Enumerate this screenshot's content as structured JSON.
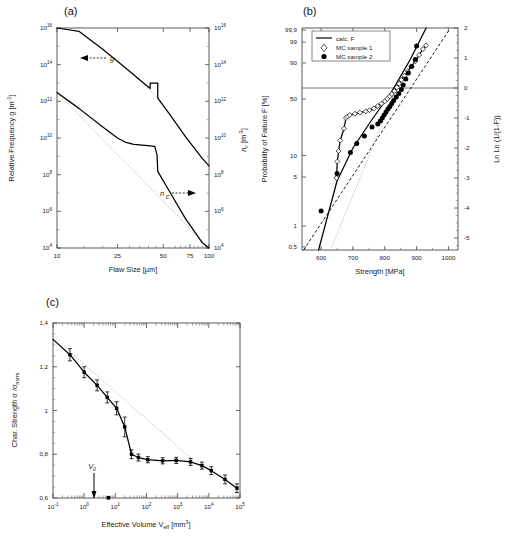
{
  "figure": {
    "panels": [
      "(a)",
      "(b)",
      "(c)"
    ]
  },
  "panel_a": {
    "label": "(a)",
    "xlabel": "Flaw Size [µm]",
    "ylabel_left": "Relative Frequency g  [m",
    "ylabel_left_exp": "-1",
    "ylabel_left_tail": "]",
    "ylabel_right": "n",
    "ylabel_right_sub": "c",
    "ylabel_right_unit": " [m",
    "ylabel_right_exp": "-3",
    "ylabel_right_tail": "]",
    "xticks": [
      "10",
      "25",
      "50",
      "75",
      "100"
    ],
    "yticks_left": [
      "10",
      "10",
      "10",
      "10",
      "10",
      "10",
      "10"
    ],
    "yticks_left_exp": [
      "16",
      "14",
      "12",
      "10",
      "8",
      "6",
      "4"
    ],
    "yticks_right": [
      "10",
      "10",
      "10",
      "10",
      "10",
      "10",
      "10"
    ],
    "yticks_right_exp": [
      "16",
      "14",
      "12",
      "10",
      "8",
      "6",
      "4"
    ],
    "annotation_g": "g",
    "annotation_nc": "n",
    "annotation_nc_sub": "c"
  },
  "panel_b": {
    "label": "(b)",
    "xlabel": "Strength [MPa]",
    "ylabel_left": "Probability of Failure F [%]",
    "ylabel_right": "Ln Ln (1/(1-F))",
    "xticks": [
      "600",
      "700",
      "800",
      "900",
      "1000"
    ],
    "yticks_left": [
      "99,9",
      "99",
      "90",
      "50",
      "10",
      "5",
      "1",
      "0,5"
    ],
    "yticks_right": [
      "2",
      "1",
      "0",
      "-1",
      "-2",
      "-3",
      "-4",
      "-5"
    ],
    "legend": [
      {
        "label": "calc. F",
        "marker": "line"
      },
      {
        "label": "MC sample 1",
        "marker": "open-diamond"
      },
      {
        "label": "MC sample 2",
        "marker": "filled-circle"
      }
    ]
  },
  "panel_c": {
    "label": "(c)",
    "xlabel_pre": "Effective Volume  V",
    "xlabel_sub": "eff",
    "xlabel_unit": " [mm",
    "xlabel_exp": "3",
    "xlabel_tail": "]",
    "ylabel_pre": "Char. Strength  σ /σ",
    "ylabel_sub": "norm",
    "xticks": [
      "10",
      "10",
      "10",
      "10",
      "10",
      "10",
      "10"
    ],
    "xticks_exp": [
      "-1",
      "0",
      "1",
      "2",
      "3",
      "4",
      "5"
    ],
    "yticks": [
      "1,4",
      "1,2",
      "1",
      "0,8",
      "0,6"
    ],
    "annotation_v0": "V",
    "annotation_v0_sub": "0"
  },
  "chart_data": [
    {
      "type": "line",
      "id": "panel_a",
      "title": "(a)",
      "xlabel": "Flaw Size [µm]",
      "ylabel": "Relative Frequency g [m^-1]",
      "ylabel2": "n_c [m^-3]",
      "xscale": "log",
      "yscale": "log",
      "xlim": [
        10,
        100
      ],
      "ylim": [
        10000.0,
        1e+16
      ],
      "ylim2": [
        10000.0,
        1e+16
      ],
      "grid": false,
      "series": [
        {
          "name": "n_c",
          "note": "upper straight line with rectangular pulse near 41-46 um",
          "x": [
            10,
            14,
            20,
            28,
            41,
            41,
            46,
            46,
            55,
            70,
            90,
            100
          ],
          "y": [
            1e+17,
            6500000000000000.0,
            700000000000000.0,
            70000000000000.0,
            5000000000000.0,
            10000000000000.0,
            10000000000000.0,
            1500000000000.0,
            200000000000.0,
            12000000000.0,
            800000000.0,
            300000000.0
          ]
        },
        {
          "name": "g",
          "note": "lower curve with shoulder plateau 28-45 um then sharp drop",
          "x": [
            10,
            14,
            20,
            25,
            28,
            32,
            38,
            44,
            45.5,
            46,
            55,
            70,
            90,
            100
          ],
          "y": [
            3000000000000.0,
            400000000000.0,
            40000000000.0,
            10000000000.0,
            6000000000.0,
            4500000000.0,
            4000000000.0,
            3500000000.0,
            1200000000.0,
            150000000.0,
            12000000.0,
            400000.0,
            20000.0,
            10000.0
          ]
        },
        {
          "name": "g-reference-dotted",
          "note": "dotted extrapolation of pure power law",
          "x": [
            10,
            100
          ],
          "y": [
            3000000000000.0,
            10000.0
          ]
        }
      ],
      "annotations": [
        "g (left arrow)",
        "n_c (right arrow)"
      ]
    },
    {
      "type": "scatter",
      "id": "panel_b",
      "title": "(b)",
      "xlabel": "Strength [MPa]",
      "ylabel": "Probability of Failure F [%]",
      "ylabel2": "Ln Ln (1/(1-F))",
      "xlim": [
        540,
        1030
      ],
      "ylim_weibull": [
        -5.4,
        2.0
      ],
      "ytick_percent": [
        99.9,
        99,
        90,
        50,
        10,
        5,
        1,
        0.5
      ],
      "ytick_lnln": [
        2,
        1,
        0,
        -1,
        -2,
        -3,
        -4,
        -5
      ],
      "grid": false,
      "legend_position": "top-left",
      "series": [
        {
          "name": "calc. F",
          "marker": "line",
          "note": "solid calculated line, steep",
          "x": [
            592,
            650,
            700,
            760,
            820,
            880,
            930
          ],
          "y_lnln": [
            -5.4,
            -3.1,
            -2.0,
            -1.05,
            -0.15,
            0.95,
            2.0
          ]
        },
        {
          "name": "MC sample 1",
          "marker": "open-diamond",
          "x": [
            648,
            651,
            655,
            660,
            672,
            678,
            683,
            690,
            706,
            722,
            740,
            752,
            766,
            778,
            790,
            800,
            808,
            815,
            822,
            830,
            838,
            845,
            852,
            862,
            872,
            884,
            896,
            908,
            920,
            930
          ],
          "y_lnln": [
            -3.0,
            -2.45,
            -2.1,
            -1.75,
            -1.35,
            -1.0,
            -0.95,
            -0.9,
            -0.86,
            -0.82,
            -0.78,
            -0.74,
            -0.68,
            -0.6,
            -0.52,
            -0.44,
            -0.36,
            -0.28,
            -0.2,
            -0.1,
            0.02,
            0.14,
            0.27,
            0.41,
            0.56,
            0.72,
            0.9,
            1.1,
            1.3,
            1.42
          ]
        },
        {
          "name": "MC sample 2",
          "marker": "filled-circle",
          "x": [
            600,
            650,
            692,
            712,
            736,
            760,
            778,
            786,
            792,
            798,
            804,
            810,
            816,
            822,
            828,
            836,
            844,
            852,
            858,
            866,
            874,
            884,
            896,
            900
          ],
          "y_lnln": [
            -4.1,
            -2.85,
            -2.15,
            -1.85,
            -1.6,
            -1.3,
            -1.2,
            -1.1,
            -1.0,
            -0.9,
            -0.8,
            -0.7,
            -0.62,
            -0.52,
            -0.42,
            -0.3,
            -0.18,
            -0.05,
            0.1,
            0.3,
            0.5,
            0.72,
            0.95,
            1.4
          ]
        },
        {
          "name": "dashed-reference",
          "marker": "dashed-line",
          "x": [
            545,
            1000
          ],
          "y_lnln": [
            -5.4,
            1.9
          ]
        },
        {
          "name": "dotted-reference",
          "marker": "dotted-line",
          "x": [
            630,
            860
          ],
          "y_lnln": [
            -5.4,
            0.6
          ]
        }
      ],
      "reference_lines": [
        {
          "type": "horizontal",
          "y_lnln": 0
        }
      ]
    },
    {
      "type": "line",
      "id": "panel_c",
      "title": "(c)",
      "xlabel": "Effective Volume V_eff [mm^3]",
      "ylabel": "Char. Strength σ/σ_norm",
      "xscale": "log",
      "xlim": [
        0.1,
        100000
      ],
      "ylim": [
        0.6,
        1.4
      ],
      "grid": false,
      "series": [
        {
          "name": "char-strength",
          "marker": "filled-square-with-errorbars",
          "x": [
            0.35,
            1.0,
            2.6,
            5.5,
            11,
            20,
            33,
            55,
            110,
            330,
            900,
            2600,
            6000,
            12000,
            33000,
            80000
          ],
          "y": [
            1.255,
            1.175,
            1.115,
            1.06,
            1.01,
            0.925,
            0.8,
            0.785,
            0.775,
            0.77,
            0.772,
            0.765,
            0.748,
            0.725,
            0.685,
            0.645
          ],
          "yerr": [
            0.028,
            0.025,
            0.025,
            0.025,
            0.03,
            0.045,
            0.02,
            0.016,
            0.014,
            0.014,
            0.014,
            0.016,
            0.016,
            0.018,
            0.02,
            0.02
          ]
        },
        {
          "name": "dotted-reference",
          "marker": "dotted-line",
          "x": [
            0.2,
            3000
          ],
          "y": [
            1.3,
            0.775
          ]
        }
      ],
      "annotations": [
        {
          "text": "V_0",
          "x": 6.0,
          "note": "vertical marker arrow at bottom axis"
        }
      ]
    }
  ]
}
